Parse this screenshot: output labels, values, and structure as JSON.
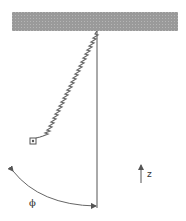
{
  "diagram": {
    "type": "spring pendulum",
    "labels": {
      "angle": "ϕ",
      "axis": "z"
    },
    "colors": {
      "ceiling": "#9a9a9a",
      "lines": "#555555",
      "spring": "#666666"
    }
  }
}
